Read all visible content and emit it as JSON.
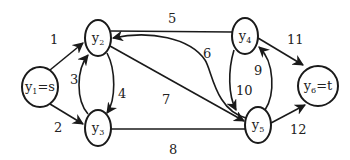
{
  "diagram": {
    "type": "directed-flow-network",
    "nodes": [
      {
        "id": "y1",
        "base": "y",
        "sub": "1",
        "suffix": "=s",
        "label": "y1=s"
      },
      {
        "id": "y2",
        "base": "y",
        "sub": "2",
        "suffix": "",
        "label": "y2"
      },
      {
        "id": "y3",
        "base": "y",
        "sub": "3",
        "suffix": "",
        "label": "y3"
      },
      {
        "id": "y4",
        "base": "y",
        "sub": "4",
        "suffix": "",
        "label": "y4"
      },
      {
        "id": "y5",
        "base": "y",
        "sub": "5",
        "suffix": "",
        "label": "y5"
      },
      {
        "id": "y6",
        "base": "y",
        "sub": "6",
        "suffix": "=t",
        "label": "y6=t"
      }
    ],
    "edges": [
      {
        "label": "1",
        "from": "y1",
        "to": "y2",
        "directed": true
      },
      {
        "label": "2",
        "from": "y1",
        "to": "y3",
        "directed": true
      },
      {
        "label": "3",
        "from": "y3",
        "to": "y2",
        "directed": true
      },
      {
        "label": "4",
        "from": "y2",
        "to": "y3",
        "directed": true
      },
      {
        "label": "5",
        "from": "y2",
        "to": "y4",
        "directed": false
      },
      {
        "label": "6",
        "from": "y5",
        "to": "y2",
        "directed": true
      },
      {
        "label": "7",
        "from": "y2",
        "to": "y5",
        "directed": true
      },
      {
        "label": "8",
        "from": "y3",
        "to": "y5",
        "directed": false
      },
      {
        "label": "9",
        "from": "y5",
        "to": "y4",
        "directed": true
      },
      {
        "label": "10",
        "from": "y4",
        "to": "y5",
        "directed": true
      },
      {
        "label": "11",
        "from": "y4",
        "to": "y6",
        "directed": true
      },
      {
        "label": "12",
        "from": "y5",
        "to": "y6",
        "directed": true
      }
    ]
  }
}
